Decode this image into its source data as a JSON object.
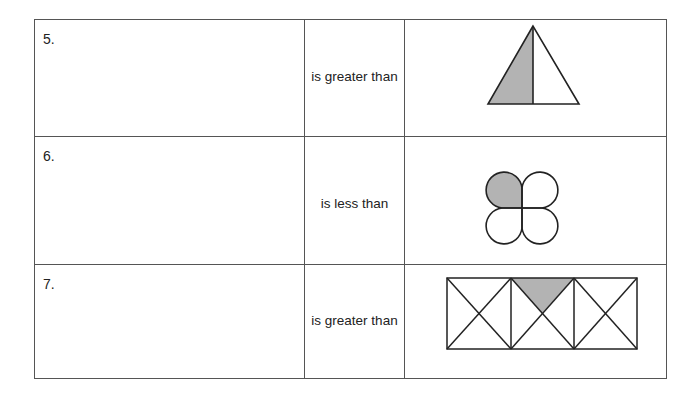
{
  "worksheet": {
    "rows": [
      {
        "number": "5.",
        "comparison": "is greater than",
        "figure": "triangle-half-shaded",
        "shaded_fraction": "1/2"
      },
      {
        "number": "6.",
        "comparison": "is less than",
        "figure": "four-petal-flower-one-shaded",
        "shaded_fraction": "1/4"
      },
      {
        "number": "7.",
        "comparison": "is greater than",
        "figure": "three-squares-diagonals-one-triangle-shaded",
        "shaded_fraction": "1/12"
      }
    ],
    "colors": {
      "shade": "#b3b3b3",
      "line": "#222222",
      "border": "#555555"
    }
  }
}
